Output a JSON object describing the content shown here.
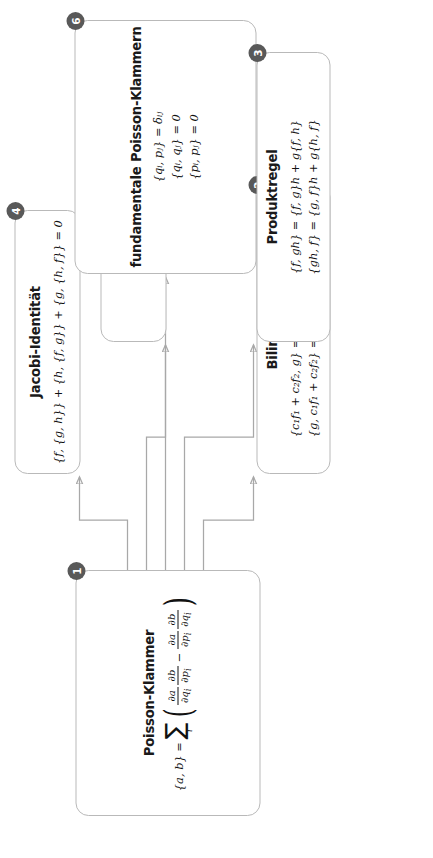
{
  "diagram": {
    "orientation": "rotated-90-ccw",
    "accent_badge_color": "#595959",
    "box_border_color": "#b9b9b9",
    "connector_color": "#a8a8a8",
    "nodes": [
      {
        "id": 1,
        "badge": "1",
        "title": "Poisson-Klammer",
        "lhs": "{a, b} =",
        "sum_symbol": "∑",
        "sum_index": "i",
        "fraction_1_num": "∂a",
        "fraction_1_den": "∂q",
        "fraction_1_den_sub": "i",
        "fraction_2_num": "∂b",
        "fraction_2_den": "∂p",
        "fraction_2_den_sub": "i",
        "operator": "−",
        "fraction_3_num": "∂a",
        "fraction_3_den": "∂p",
        "fraction_3_den_sub": "i",
        "fraction_4_num": "∂b",
        "fraction_4_den": "∂q",
        "fraction_4_den_sub": "i",
        "formula_plain": "{a, b} = ∑ᵢ ( ∂a/∂qᵢ · ∂b/∂pᵢ − ∂a/∂pᵢ · ∂b/∂qᵢ )"
      },
      {
        "id": 2,
        "badge": "2",
        "title": "Bilinearität",
        "formulas": [
          "{c₁f₁ + c₂f₂, g} = c₁{f₁, g} + c₂{f₂, g}",
          "{g, c₁f₁ + c₂f₂} = c₁{g, f₁} + c₂{g, f₂}"
        ]
      },
      {
        "id": 3,
        "badge": "3",
        "title": "Produktregel",
        "formulas": [
          "{f, gh} = {f, g}h + g{f, h}",
          "{gh, f} = {g, f}h + g{h, f}"
        ]
      },
      {
        "id": 4,
        "badge": "4",
        "title": "Jacobi-Identität",
        "formulas": [
          "{f, {g, h}} + {h, {f, g}} + {g, {h, f}} = 0"
        ]
      },
      {
        "id": 5,
        "badge": "5",
        "title": "Antisymmetrie",
        "formulas": [
          "{f, g} = −{g, f}"
        ]
      },
      {
        "id": 6,
        "badge": "6",
        "title": "fundamentale Poisson-Klammern",
        "formulas": [
          "{qᵢ, pⱼ} = δᵢⱼ",
          "{qᵢ, qⱼ} = 0",
          "{pᵢ, pⱼ} = 0"
        ]
      }
    ],
    "edges": [
      {
        "from": 1,
        "to": 4
      },
      {
        "from": 1,
        "to": 5
      },
      {
        "from": 1,
        "to": 6
      },
      {
        "from": 1,
        "to": 3
      },
      {
        "from": 1,
        "to": 2
      }
    ]
  }
}
